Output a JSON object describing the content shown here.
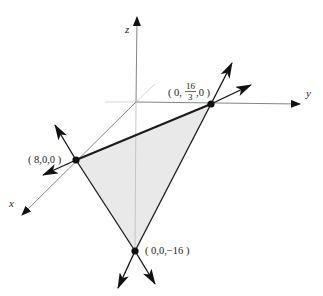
{
  "diagram": {
    "type": "3d-plane-intercepts",
    "axes": {
      "x_label": "x",
      "y_label": "y",
      "z_label": "z"
    },
    "points": [
      {
        "id": "x-intercept",
        "label": "( 8,0,0 )",
        "coords": [
          8,
          0,
          0
        ]
      },
      {
        "id": "y-intercept",
        "label_prefix": "( 0,",
        "label_num": "16",
        "label_den": "3",
        "label_suffix": ",0 )",
        "coords": [
          0,
          "16/3",
          0
        ]
      },
      {
        "id": "z-intercept",
        "label": "( 0,0,−16 )",
        "coords": [
          0,
          0,
          -16
        ]
      }
    ],
    "shaded_region": "triangle connecting the three intercepts",
    "colors": {
      "line": "#1a1a1a",
      "axis": "#555555",
      "fill": "#e8e8e8",
      "point": "#111111"
    }
  }
}
